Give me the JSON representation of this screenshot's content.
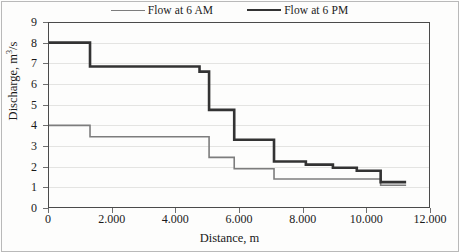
{
  "chart_data": {
    "type": "line",
    "subtype": "step-post",
    "title": "",
    "xlabel": "Distance, m",
    "ylabel": "Discharge, m3/s",
    "ylabel_display": "Discharge, m",
    "ylabel_sup": "3",
    "ylabel_tail": "/s",
    "xlim": [
      0,
      12000
    ],
    "ylim": [
      0,
      9
    ],
    "xticks": [
      0,
      2000,
      4000,
      6000,
      8000,
      10000,
      12000
    ],
    "xtick_labels": [
      "0",
      "2.000",
      "4.000",
      "6.000",
      "8.000",
      "10.000",
      "12.000"
    ],
    "yticks": [
      0,
      1,
      2,
      3,
      4,
      5,
      6,
      7,
      8,
      9
    ],
    "ytick_labels": [
      "0",
      "1",
      "2",
      "3",
      "4",
      "5",
      "6",
      "7",
      "8",
      "9"
    ],
    "grid": "horizontal",
    "legend_position": "top-center",
    "series": [
      {
        "name": "Flow at 6 AM",
        "color": "#7d7d7d",
        "line_width": 1.6,
        "x": [
          0,
          1320,
          5060,
          5850,
          7100,
          10450,
          11250
        ],
        "y": [
          4.0,
          3.45,
          2.45,
          1.9,
          1.4,
          1.1,
          1.1
        ]
      },
      {
        "name": "Flow at 6 PM",
        "color": "#333333",
        "line_width": 2.6,
        "x": [
          0,
          1320,
          4760,
          5060,
          5850,
          7100,
          8100,
          8950,
          9700,
          10450,
          11250
        ],
        "y": [
          8.0,
          6.85,
          6.6,
          4.75,
          3.3,
          2.25,
          2.1,
          1.95,
          1.8,
          1.25,
          1.25
        ]
      }
    ]
  },
  "legend": {
    "entries": [
      {
        "label": "Flow at 6 AM",
        "swatch": "am"
      },
      {
        "label": "Flow at 6 PM",
        "swatch": "pm"
      }
    ]
  }
}
